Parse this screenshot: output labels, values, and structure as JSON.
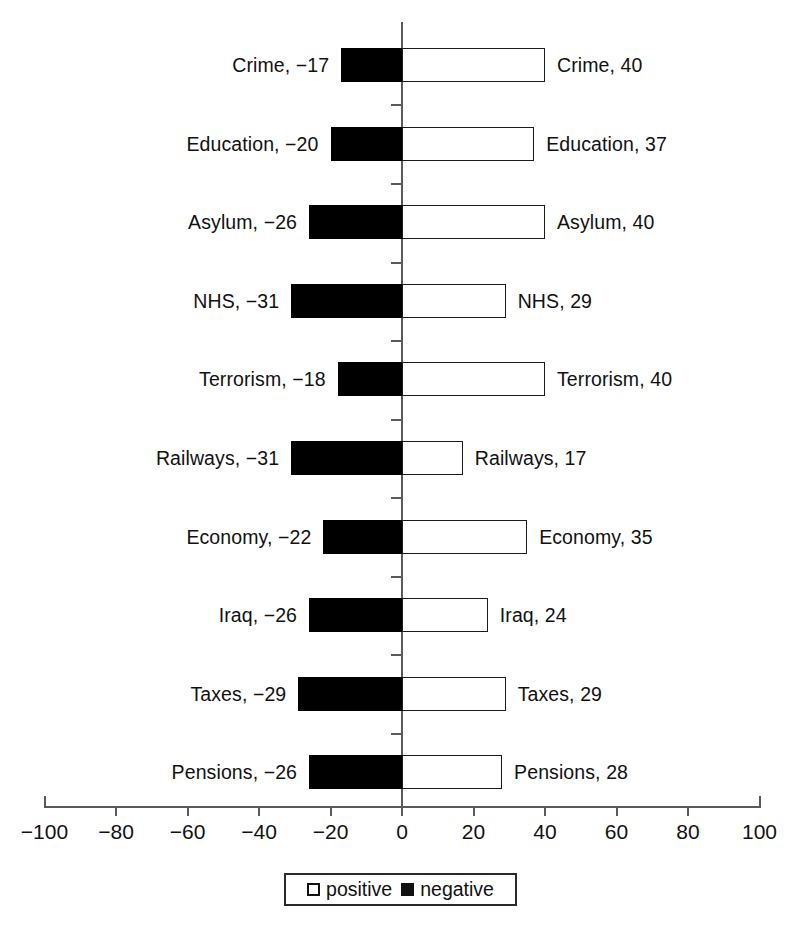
{
  "chart_data": {
    "type": "bar",
    "title": "",
    "subtitle": "",
    "xlabel": "",
    "ylabel": "",
    "orientation": "horizontal",
    "layout": "diverging-bar",
    "grid": false,
    "xlim": [
      -100,
      100
    ],
    "xticks": [
      -100,
      -80,
      -60,
      -40,
      -20,
      0,
      20,
      40,
      60,
      80,
      100
    ],
    "xtick_labels": [
      "−100",
      "−80",
      "−60",
      "−40",
      "−20",
      "0",
      "20",
      "40",
      "60",
      "80",
      "100"
    ],
    "legend_position": "bottom-center",
    "categories": [
      "Crime",
      "Education",
      "Asylum",
      "NHS",
      "Terrorism",
      "Railways",
      "Economy",
      "Iraq",
      "Taxes",
      "Pensions"
    ],
    "series": [
      {
        "name": "positive",
        "color": "#ffffff",
        "values": [
          40,
          37,
          40,
          29,
          40,
          17,
          35,
          24,
          29,
          28
        ]
      },
      {
        "name": "negative",
        "color": "#000000",
        "values": [
          -17,
          -20,
          -26,
          -31,
          -18,
          -31,
          -22,
          -26,
          -29,
          -26
        ]
      }
    ],
    "rows": [
      {
        "category": "Crime",
        "negative": -17,
        "positive": 40,
        "left_label": "Crime, −17",
        "right_label": "Crime, 40"
      },
      {
        "category": "Education",
        "negative": -20,
        "positive": 37,
        "left_label": "Education, −20",
        "right_label": "Education, 37"
      },
      {
        "category": "Asylum",
        "negative": -26,
        "positive": 40,
        "left_label": "Asylum, −26",
        "right_label": "Asylum, 40"
      },
      {
        "category": "NHS",
        "negative": -31,
        "positive": 29,
        "left_label": "NHS, −31",
        "right_label": "NHS, 29"
      },
      {
        "category": "Terrorism",
        "negative": -18,
        "positive": 40,
        "left_label": "Terrorism, −18",
        "right_label": "Terrorism, 40"
      },
      {
        "category": "Railways",
        "negative": -31,
        "positive": 17,
        "left_label": "Railways, −31",
        "right_label": "Railways, 17"
      },
      {
        "category": "Economy",
        "negative": -22,
        "positive": 35,
        "left_label": "Economy, −22",
        "right_label": "Economy, 35"
      },
      {
        "category": "Iraq",
        "negative": -26,
        "positive": 24,
        "left_label": "Iraq, −26",
        "right_label": "Iraq, 24"
      },
      {
        "category": "Taxes",
        "negative": -29,
        "positive": 29,
        "left_label": "Taxes, −29",
        "right_label": "Taxes, 29"
      },
      {
        "category": "Pensions",
        "negative": -26,
        "positive": 28,
        "left_label": "Pensions, −26",
        "right_label": "Pensions, 28"
      }
    ],
    "legend": [
      {
        "label": "positive",
        "swatch": "open-square",
        "color": "#ffffff"
      },
      {
        "label": "negative",
        "swatch": "filled-square",
        "color": "#000000"
      }
    ]
  },
  "caption_fragment": ""
}
